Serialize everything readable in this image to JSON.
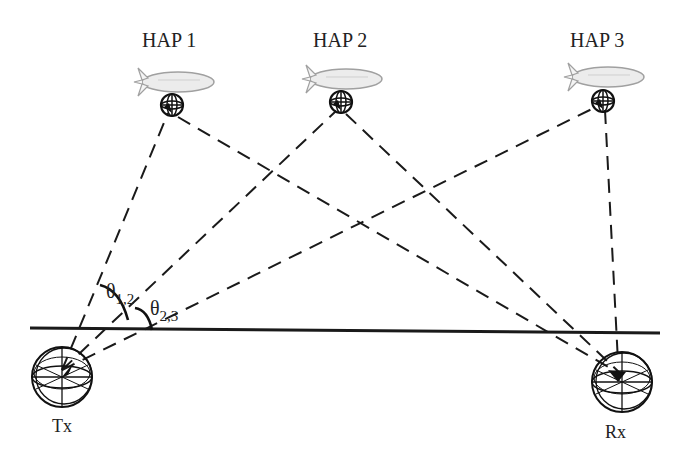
{
  "diagram": {
    "haps": [
      {
        "label": "HAP 1",
        "x": 168,
        "label_y": 47,
        "blimp_y": 82,
        "antenna_y": 113
      },
      {
        "label": "HAP 2",
        "x": 338,
        "label_y": 47,
        "blimp_y": 82,
        "antenna_y": 110
      },
      {
        "label": "HAP 3",
        "x": 605,
        "label_y": 47,
        "blimp_y": 82,
        "antenna_y": 104
      }
    ],
    "tx": {
      "label": "Tx",
      "x": 62,
      "y": 370
    },
    "rx": {
      "label": "Rx",
      "x": 622,
      "y": 375
    },
    "angles": [
      {
        "symbol": "θ",
        "subscript": "1,2",
        "label": "θ1,2"
      },
      {
        "symbol": "θ",
        "subscript": "2,3",
        "label": "θ2,3"
      }
    ],
    "ground_line": {
      "x1": 30,
      "y1": 328,
      "x2": 660,
      "y2": 333
    },
    "line_color": "#1a1a1a",
    "blimp_fill": "#e9e9e9",
    "blimp_stroke": "#9a9a9a"
  }
}
